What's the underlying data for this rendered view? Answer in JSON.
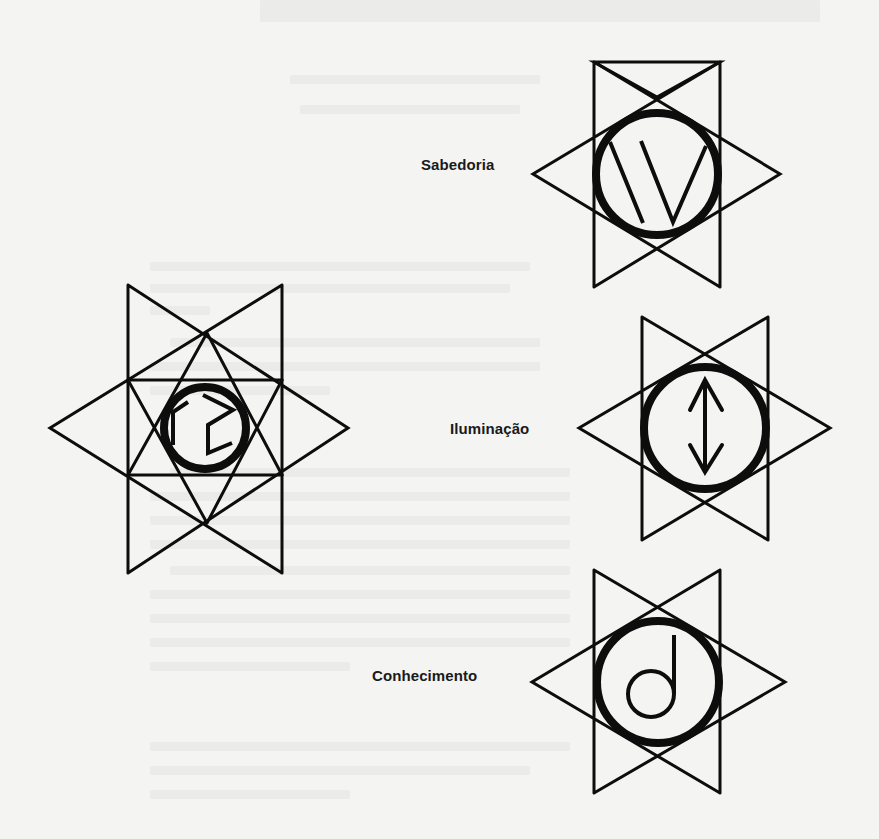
{
  "page": {
    "background": "#f4f4f2",
    "ink": "#0d0d0d"
  },
  "labels": {
    "sabedoria": "Sabedoria",
    "iluminacao": "Iluminação",
    "conhecimento": "Conhecimento"
  },
  "symbols": [
    {
      "id": "sabedoria",
      "label": "Sabedoria",
      "glyph": "three-strokes-v",
      "center": [
        657,
        174
      ]
    },
    {
      "id": "left-star",
      "label": "",
      "glyph": "cube-fragment",
      "center": [
        207,
        428
      ]
    },
    {
      "id": "iluminacao",
      "label": "Iluminação",
      "glyph": "double-arrow",
      "center": [
        705,
        428
      ]
    },
    {
      "id": "conhecimento",
      "label": "Conhecimento",
      "glyph": "d-note",
      "center": [
        658,
        682
      ]
    }
  ]
}
